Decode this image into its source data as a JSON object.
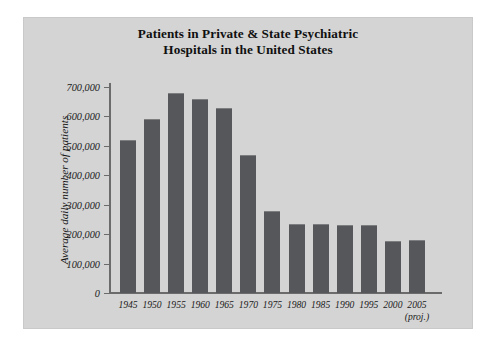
{
  "chart_data": {
    "type": "bar",
    "title": "Patients in Private & State Psychiatric Hospitals in the United States",
    "title_line1": "Patients in Private & State Psychiatric",
    "title_line2": "Hospitals in the United States",
    "xlabel": "",
    "ylabel": "Average daily number of patients",
    "ylim": [
      0,
      700000
    ],
    "ytick_labels": [
      "700,000",
      "600,000",
      "500,000",
      "400,000",
      "300,000",
      "200,000",
      "100,000",
      "0"
    ],
    "ytick_values": [
      700000,
      600000,
      500000,
      400000,
      300000,
      200000,
      100000,
      0
    ],
    "grid": false,
    "legend": null,
    "bar_color": "#56575a",
    "panel_color": "#d4d4d4",
    "categories": [
      "1945",
      "1950",
      "1955",
      "1960",
      "1965",
      "1970",
      "1975",
      "1980",
      "1985",
      "1990",
      "1995",
      "2000",
      "2005"
    ],
    "category_sublabels": [
      "",
      "",
      "",
      "",
      "",
      "",
      "",
      "",
      "",
      "",
      "",
      "",
      "(proj.)"
    ],
    "values": [
      520000,
      590000,
      680000,
      660000,
      630000,
      470000,
      280000,
      235000,
      235000,
      230000,
      230000,
      178000,
      180000
    ]
  }
}
